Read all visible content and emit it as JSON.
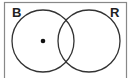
{
  "diagram": {
    "type": "venn",
    "sets": [
      {
        "label": "B",
        "position": "left"
      },
      {
        "label": "R",
        "position": "right"
      }
    ],
    "marker": {
      "region": "B only",
      "symbol": "dot"
    },
    "colors": {
      "stroke": "#333333",
      "background": "#ffffff",
      "frame": "#888888"
    }
  }
}
